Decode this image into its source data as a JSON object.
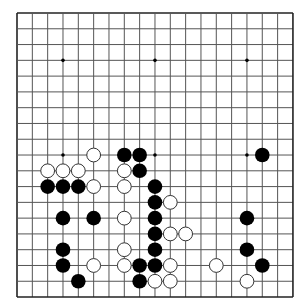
{
  "board": {
    "size": 19,
    "origin_x": 17,
    "origin_y": 13,
    "spacing_x": 15.33,
    "spacing_y": 15.78,
    "stone_radius": 7.3,
    "line_color": "#555555",
    "border_color": "#222222",
    "background": "#ffffff",
    "black_color": "#000000",
    "white_fill": "#ffffff",
    "white_stroke": "#333333",
    "star_points": [
      [
        3,
        3
      ],
      [
        9,
        3
      ],
      [
        15,
        3
      ],
      [
        3,
        9
      ],
      [
        9,
        9
      ],
      [
        15,
        9
      ],
      [
        3,
        15
      ],
      [
        9,
        15
      ],
      [
        15,
        15
      ]
    ],
    "black_stones": [
      [
        7,
        9
      ],
      [
        8,
        9
      ],
      [
        16,
        9
      ],
      [
        8,
        10
      ],
      [
        2,
        11
      ],
      [
        3,
        11
      ],
      [
        4,
        11
      ],
      [
        9,
        11
      ],
      [
        9,
        12
      ],
      [
        3,
        13
      ],
      [
        5,
        13
      ],
      [
        9,
        13
      ],
      [
        15,
        13
      ],
      [
        9,
        14
      ],
      [
        3,
        15
      ],
      [
        9,
        15
      ],
      [
        15,
        15
      ],
      [
        3,
        16
      ],
      [
        8,
        16
      ],
      [
        9,
        16
      ],
      [
        16,
        16
      ],
      [
        4,
        17
      ],
      [
        8,
        17
      ]
    ],
    "white_stones": [
      [
        5,
        9
      ],
      [
        2,
        10
      ],
      [
        3,
        10
      ],
      [
        4,
        10
      ],
      [
        7,
        10
      ],
      [
        5,
        11
      ],
      [
        7,
        11
      ],
      [
        10,
        12
      ],
      [
        7,
        13
      ],
      [
        10,
        14
      ],
      [
        11,
        14
      ],
      [
        7,
        15
      ],
      [
        5,
        16
      ],
      [
        7,
        16
      ],
      [
        10,
        16
      ],
      [
        13,
        16
      ],
      [
        9,
        17
      ],
      [
        10,
        17
      ],
      [
        15,
        17
      ]
    ]
  }
}
